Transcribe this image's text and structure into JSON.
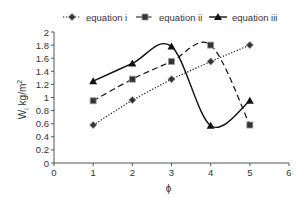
{
  "chart_data": {
    "type": "line",
    "title": "",
    "xlabel": "ϕ",
    "ylabel": "W",
    "ylabel_sub": "i",
    "ylabel_unit": " kg/m",
    "ylabel_sup": "2",
    "xlim": [
      0,
      6
    ],
    "ylim": [
      0,
      2
    ],
    "x_ticks": [
      0,
      1,
      2,
      3,
      4,
      5,
      6
    ],
    "y_ticks": [
      0,
      0.2,
      0.4,
      0.6,
      0.8,
      1,
      1.2,
      1.4,
      1.6,
      1.8,
      2
    ],
    "y_tick_labels": [
      "0",
      "0.2",
      "0.4",
      "0.6",
      "0.8",
      "1",
      "1.2",
      "1.4",
      "1.6",
      "1.8",
      "2"
    ],
    "grid": false,
    "legend_position": "top",
    "x": [
      1,
      2,
      3,
      4,
      5
    ],
    "series": [
      {
        "name": "equation i",
        "marker": "diamond",
        "line": "dotted",
        "smooth": false,
        "values": [
          0.58,
          0.96,
          1.28,
          1.55,
          1.8
        ]
      },
      {
        "name": "equation ii",
        "marker": "square",
        "line": "dashed",
        "smooth": true,
        "values": [
          0.95,
          1.28,
          1.55,
          1.8,
          0.58
        ]
      },
      {
        "name": "equation iii",
        "marker": "triangle",
        "line": "solid",
        "smooth": true,
        "values": [
          1.25,
          1.52,
          1.78,
          0.57,
          0.95
        ]
      }
    ]
  },
  "legend": {
    "items": [
      {
        "label": "equation i"
      },
      {
        "label": "equation ii"
      },
      {
        "label": "equation iii"
      }
    ]
  },
  "colors": {
    "line": "#111111",
    "axis": "#555555",
    "marker_fill": "#333333"
  }
}
